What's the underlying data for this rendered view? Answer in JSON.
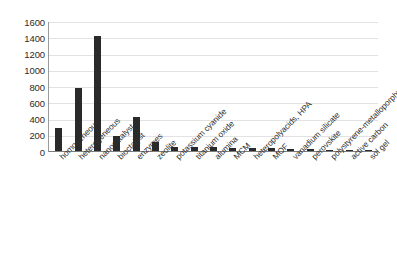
{
  "chart_data": {
    "type": "bar",
    "title": "",
    "subtitle": "",
    "xlabel": "",
    "ylabel": "",
    "ylim": [
      0,
      1600
    ],
    "yticks": [
      0,
      200,
      400,
      600,
      800,
      1000,
      1200,
      1400,
      1600
    ],
    "ytick_labels": [
      "0",
      "200",
      "400",
      "600",
      "800",
      "1000",
      "1200",
      "1400",
      "1600"
    ],
    "grid": true,
    "legend": false,
    "legend_position": "none",
    "bar_color": "#2a2a2a",
    "categories": [
      "homogeneous",
      "heterogeneous",
      "nanocatalyst",
      "bioctalyst",
      "enzymes",
      "zeolite",
      "potassium cyanide",
      "titanium oxide",
      "alumina",
      "MCM",
      "heteropolyacids, HPA",
      "MOF",
      "vanadium silicate",
      "perovskite",
      "polystyrene-metalloporphyrins",
      "active carbon",
      "sol gel"
    ],
    "values": [
      280,
      770,
      1410,
      180,
      415,
      115,
      55,
      50,
      45,
      40,
      38,
      35,
      30,
      20,
      8,
      6,
      4
    ]
  },
  "axis": {
    "y_label_0": "0",
    "y_label_200": "200",
    "y_label_400": "400",
    "y_label_600": "600",
    "y_label_800": "800",
    "y_label_1000": "1000",
    "y_label_1200": "1200",
    "y_label_1400": "1400",
    "y_label_1600": "1600"
  }
}
